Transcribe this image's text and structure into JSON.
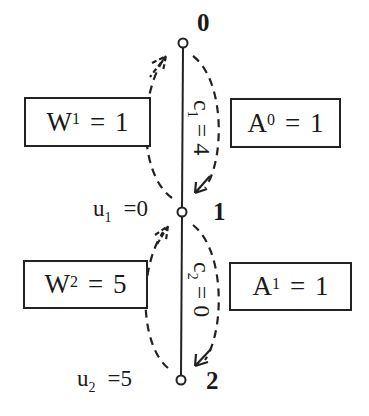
{
  "nodes": [
    {
      "id": "0",
      "label": "0"
    },
    {
      "id": "1",
      "label": "1"
    },
    {
      "id": "2",
      "label": "2"
    }
  ],
  "edges": [
    {
      "from": "0",
      "to": "1",
      "cost_var": "c",
      "cost_sub": "1",
      "cost_eq": "=",
      "cost_value": "4"
    },
    {
      "from": "1",
      "to": "2",
      "cost_var": "c",
      "cost_sub": "2",
      "cost_eq": "=",
      "cost_value": "0"
    }
  ],
  "boxes": {
    "w1": {
      "var": "W",
      "sup": "1",
      "eq": "=",
      "value": "1"
    },
    "a0": {
      "var": "A",
      "sup": "0",
      "eq": "=",
      "value": "1"
    },
    "w2": {
      "var": "W",
      "sup": "2",
      "eq": "=",
      "value": "5"
    },
    "a1": {
      "var": "A",
      "sup": "1",
      "eq": "=",
      "value": "1"
    }
  },
  "potentials": [
    {
      "var": "u",
      "sub": "1",
      "eq": "=",
      "value": "0"
    },
    {
      "var": "u",
      "sub": "2",
      "eq": "=",
      "value": "5"
    }
  ],
  "colors": {
    "line": "#222222",
    "background": "#ffffff"
  }
}
